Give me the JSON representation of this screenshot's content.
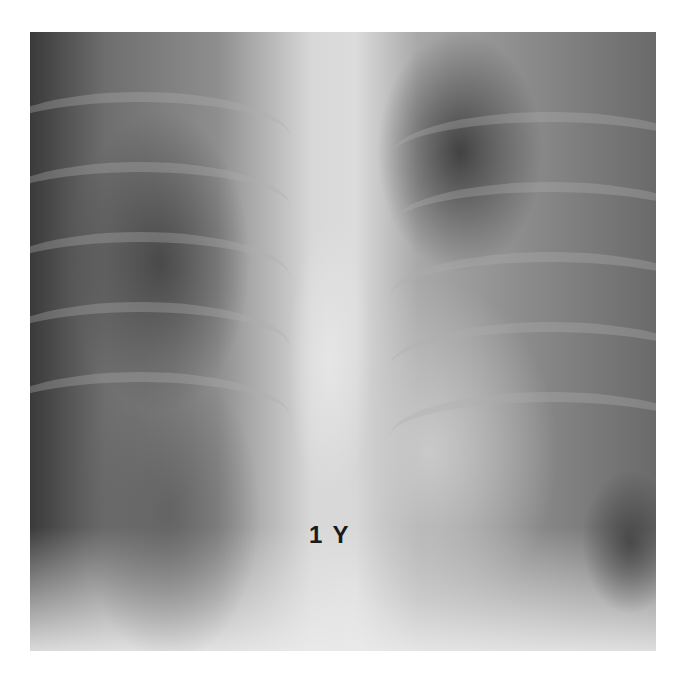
{
  "image": {
    "subject": "chest-xray",
    "annotation_label": "1 Y"
  }
}
